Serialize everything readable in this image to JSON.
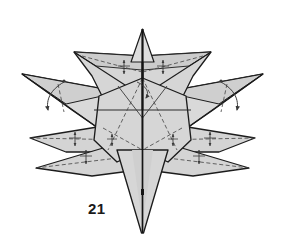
{
  "figure": {
    "kind": "origami-fold-diagram",
    "step_label": "21",
    "canvas": {
      "width": 285,
      "height": 247
    },
    "colors": {
      "background": "#ffffff",
      "paper_front": "#d6d6d6",
      "paper_front_light": "#e2e2e2",
      "paper_shadow": "#c2c2c2",
      "paper_highlight": "#ececec",
      "outline": "#1c1c1c",
      "crease_valley": "#4a4a4a",
      "crease_mountain": "#2a2a2a",
      "arrow": "#3a3a3a",
      "label_text": "#1a1a1a"
    },
    "stroke_widths": {
      "outline": 1.4,
      "edge": 1.0,
      "crease": 0.8,
      "arrow": 0.9
    },
    "dash_patterns": {
      "valley_fold": "4,2.5",
      "hidden_edge": "3,2"
    },
    "parts": [
      {
        "name": "top-spike",
        "points": 1,
        "direction": "up"
      },
      {
        "name": "bottom-spike",
        "points": 1,
        "direction": "down"
      },
      {
        "name": "upper-left-wing",
        "points": 1,
        "direction": "upper-left"
      },
      {
        "name": "upper-right-wing",
        "points": 1,
        "direction": "upper-right"
      },
      {
        "name": "left-outer-spike",
        "points": 1,
        "direction": "left"
      },
      {
        "name": "right-outer-spike",
        "points": 1,
        "direction": "right"
      },
      {
        "name": "lower-left-spike",
        "points": 1,
        "direction": "lower-left"
      },
      {
        "name": "lower-right-spike",
        "points": 1,
        "direction": "lower-right"
      },
      {
        "name": "central-diamond-body",
        "points": 1,
        "direction": "center"
      }
    ],
    "annotations": {
      "fold_arrow_count": 8,
      "curved_arrow_count": 2,
      "center_axis": "vertical mountain fold through entire model"
    }
  }
}
